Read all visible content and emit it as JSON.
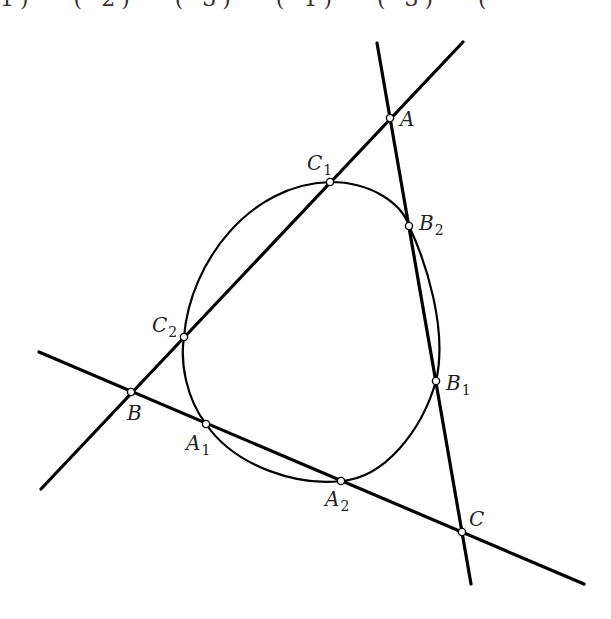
{
  "diagram": {
    "type": "geometry-construction",
    "top_clipped_text": "1) · (     2) · (     3) · (     1) · (     3) · (",
    "lines": [
      {
        "name": "line-BA",
        "through": [
          "B",
          "C2",
          "C1",
          "A"
        ],
        "from": [
          41,
          489
        ],
        "to": [
          463,
          42
        ]
      },
      {
        "name": "line-AC",
        "through": [
          "A",
          "B2",
          "B1",
          "C"
        ],
        "from": [
          377,
          43
        ],
        "to": [
          471,
          584
        ]
      },
      {
        "name": "line-BC",
        "through": [
          "B",
          "A1",
          "A2",
          "C"
        ],
        "from": [
          39,
          352
        ],
        "to": [
          584,
          584
        ]
      }
    ],
    "conic": {
      "name": "oval-curve",
      "through": [
        "C1",
        "B2",
        "B1",
        "A2",
        "A1",
        "C2"
      ]
    },
    "points": [
      {
        "id": "A",
        "label": "A",
        "sub": "",
        "x": 390,
        "y": 118,
        "lx": 400,
        "ly": 126
      },
      {
        "id": "B",
        "label": "B",
        "sub": "",
        "x": 131,
        "y": 392,
        "lx": 127,
        "ly": 420
      },
      {
        "id": "C",
        "label": "C",
        "sub": "",
        "x": 462,
        "y": 532,
        "lx": 469,
        "ly": 526
      },
      {
        "id": "A1",
        "label": "A",
        "sub": "1",
        "x": 206,
        "y": 424,
        "lx": 186,
        "ly": 450
      },
      {
        "id": "A2",
        "label": "A",
        "sub": "2",
        "x": 341,
        "y": 481,
        "lx": 325,
        "ly": 506
      },
      {
        "id": "B1",
        "label": "B",
        "sub": "1",
        "x": 436,
        "y": 381,
        "lx": 446,
        "ly": 390
      },
      {
        "id": "B2",
        "label": "B",
        "sub": "2",
        "x": 409,
        "y": 226,
        "lx": 419,
        "ly": 230
      },
      {
        "id": "C1",
        "label": "C",
        "sub": "1",
        "x": 330,
        "y": 182,
        "lx": 307,
        "ly": 170
      },
      {
        "id": "C2",
        "label": "C",
        "sub": "2",
        "x": 184,
        "y": 337,
        "lx": 152,
        "ly": 332
      }
    ]
  }
}
